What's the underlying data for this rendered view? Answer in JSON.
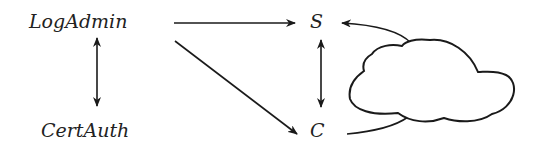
{
  "nodes": {
    "log_admin": "LogAdmin",
    "cert_auth": "CertAuth",
    "server": "S",
    "client": "C"
  },
  "edges": [
    {
      "from": "LogAdmin",
      "to": "S",
      "type": "directed"
    },
    {
      "from": "LogAdmin",
      "to": "C",
      "type": "directed"
    },
    {
      "from": "LogAdmin",
      "to": "CertAuth",
      "type": "bidirectional"
    },
    {
      "from": "S",
      "to": "C",
      "type": "bidirectional"
    },
    {
      "from": "C",
      "to": "S",
      "type": "directed",
      "via": "cloud"
    }
  ],
  "colors": {
    "stroke": "#1a1a1a",
    "background": "#ffffff"
  }
}
